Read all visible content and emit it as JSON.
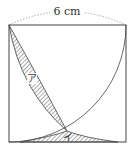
{
  "figure": {
    "dimension_label": "6 cm",
    "region_a_label": "ア",
    "region_b_label": "イ",
    "colors": {
      "line": "#444444",
      "hatch": "#444444",
      "dashed": "#999999",
      "background": "#ffffff"
    }
  }
}
